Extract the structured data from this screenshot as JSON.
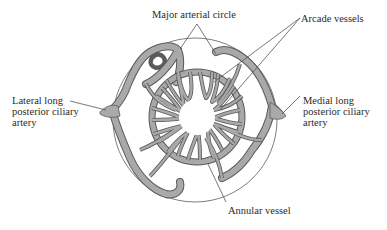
{
  "diagram": {
    "type": "anatomical vascular diagram",
    "colors": {
      "vessel_fill": "#a9a9a9",
      "vessel_stroke": "#5a5a5a",
      "outline": "#6e6e6e",
      "leader": "#555555",
      "text": "#2b2b2b",
      "background": "#ffffff"
    },
    "labels": {
      "major_arterial_circle": "Major arterial circle",
      "arcade_vessels": "Arcade vessels",
      "lateral": [
        "Lateral long",
        "posterior ciliary",
        "artery"
      ],
      "medial": [
        "Medial long",
        "posterior ciliary",
        "artery"
      ],
      "annular_vessel": "Annular vessel"
    }
  }
}
